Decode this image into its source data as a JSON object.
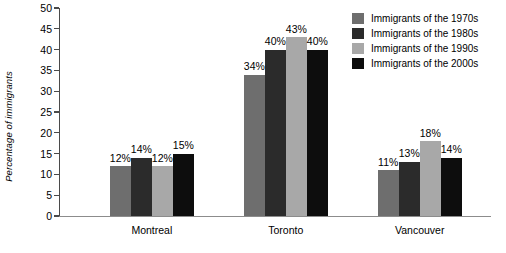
{
  "chart_data": {
    "type": "bar",
    "title": "",
    "subtitle": "",
    "xlabel": "",
    "ylabel": "Percentage of immigrants",
    "categories": [
      "Montreal",
      "Toronto",
      "Vancouver"
    ],
    "series": [
      {
        "name": "Immigrants of the 1970s",
        "color": "#6e6e6e",
        "values": [
          12,
          34,
          11
        ]
      },
      {
        "name": "Immigrants of the 1980s",
        "color": "#2b2b2b",
        "values": [
          14,
          40,
          13
        ]
      },
      {
        "name": "Immigrants of the 1990s",
        "color": "#a8a8a8",
        "values": [
          12,
          43,
          18
        ]
      },
      {
        "name": "Immigrants of the 2000s",
        "color": "#0d0d0d",
        "values": [
          15,
          40,
          14
        ]
      }
    ],
    "value_labels": [
      [
        "12%",
        "14%",
        "12%",
        "15%"
      ],
      [
        "34%",
        "40%",
        "43%",
        "40%"
      ],
      [
        "11%",
        "13%",
        "18%",
        "14%"
      ]
    ],
    "ylim": [
      0,
      50
    ],
    "ytick_step": 5,
    "yticks": [
      0,
      5,
      10,
      15,
      20,
      25,
      30,
      35,
      40,
      45,
      50
    ],
    "ytick_labels": [
      "0",
      "5",
      "10",
      "15",
      "20",
      "25",
      "30",
      "35",
      "40",
      "45",
      "50"
    ],
    "grid": false,
    "legend_position": "top-right",
    "background_color": "#ffffff",
    "axis_color": "#4a4a4a"
  },
  "legend": {
    "items": [
      {
        "label": "Immigrants of the 1970s",
        "color": "#6e6e6e"
      },
      {
        "label": "Immigrants of the 1980s",
        "color": "#2b2b2b"
      },
      {
        "label": "Immigrants of the 1990s",
        "color": "#a8a8a8"
      },
      {
        "label": "Immigrants of the 2000s",
        "color": "#0d0d0d"
      }
    ]
  }
}
